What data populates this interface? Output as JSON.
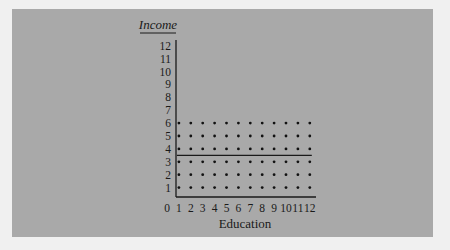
{
  "chart_data": {
    "type": "scatter",
    "title": "",
    "xlabel": "Education",
    "ylabel": "Income",
    "x_ticks": [
      "0",
      "1",
      "2",
      "3",
      "4",
      "5",
      "6",
      "7",
      "8",
      "9",
      "10",
      "11",
      "12"
    ],
    "y_ticks": [
      "1",
      "2",
      "3",
      "4",
      "5",
      "6",
      "7",
      "8",
      "9",
      "10",
      "11",
      "12"
    ],
    "xlim": [
      0,
      12
    ],
    "ylim": [
      0,
      12
    ],
    "grid": false,
    "points_description": "Uniform grid of points at every integer Education 1-12 and Income 1-6",
    "x_values": [
      1,
      2,
      3,
      4,
      5,
      6,
      7,
      8,
      9,
      10,
      11,
      12
    ],
    "y_values": [
      1,
      2,
      3,
      4,
      5,
      6
    ],
    "reference_line": {
      "type": "horizontal",
      "y": 3.5,
      "x_range": [
        1,
        12
      ]
    }
  }
}
